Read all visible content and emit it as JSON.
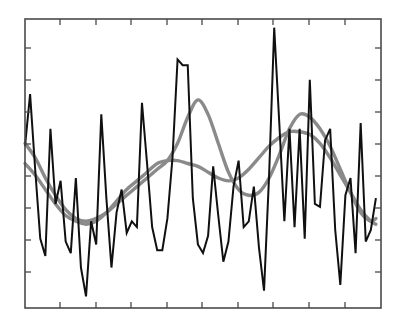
{
  "figure": {
    "title": "",
    "background_color": "#ffffff"
  },
  "axes": {
    "frame_color": "#4a4a4a",
    "frame_left": 25,
    "frame_top": 19,
    "frame_right": 381,
    "frame_bottom": 308,
    "tick_direction": "in",
    "tick_length": 6,
    "x_tick_count": 9,
    "y_tick_count": 8,
    "x_tick_positions": [
      60,
      96,
      131,
      167,
      202,
      238,
      273,
      309,
      345
    ],
    "y_tick_positions": [
      48,
      80,
      112,
      144,
      176,
      208,
      240,
      272
    ],
    "x_tick_labels": [],
    "y_tick_labels": [],
    "xlabel": "",
    "ylabel": ""
  },
  "chart_data": {
    "type": "line",
    "title": "",
    "subtitle": "",
    "xlabel": "",
    "ylabel": "",
    "xlim": [
      0,
      70
    ],
    "ylim": [
      0,
      100
    ],
    "grid": false,
    "legend": false,
    "legend_position": "none",
    "tick_labels_shown": false,
    "annotations": [],
    "series": [
      {
        "name": "observed",
        "color": "#101010",
        "line_width": 2.0,
        "style": "jagged-noisy",
        "x": [
          0,
          1,
          2,
          3,
          4,
          5,
          6,
          7,
          8,
          9,
          10,
          11,
          12,
          13,
          14,
          15,
          16,
          17,
          18,
          19,
          20,
          21,
          22,
          23,
          24,
          25,
          26,
          27,
          28,
          29,
          30,
          31,
          32,
          33,
          34,
          35,
          36,
          37,
          38,
          39,
          40,
          41,
          42,
          43,
          44,
          45,
          46,
          47,
          48,
          49,
          50,
          51,
          52,
          53,
          54,
          55,
          56,
          57,
          58,
          59,
          60,
          61,
          62,
          63,
          64,
          65,
          66,
          67,
          68,
          69
        ],
        "values": [
          56,
          74,
          48,
          24,
          18,
          62,
          36,
          44,
          23,
          19,
          45,
          14,
          4,
          30,
          22,
          67,
          38,
          14,
          33,
          41,
          26,
          30,
          28,
          71,
          50,
          28,
          20,
          20,
          31,
          52,
          86,
          84,
          84,
          38,
          22,
          19,
          25,
          49,
          32,
          16,
          23,
          42,
          51,
          28,
          30,
          42,
          21,
          6,
          46,
          97,
          64,
          30,
          62,
          28,
          62,
          24,
          79,
          36,
          35,
          58,
          62,
          27,
          8,
          39,
          45,
          19,
          64,
          23,
          27,
          38
        ]
      },
      {
        "name": "smooth-trend-a",
        "color": "#8a8a8a",
        "line_width": 3.4,
        "style": "smooth",
        "x": [
          0,
          2,
          4,
          6,
          8,
          10,
          12,
          14,
          16,
          18,
          20,
          22,
          24,
          26,
          28,
          30,
          32,
          34,
          36,
          38,
          40,
          42,
          44,
          46,
          48,
          50,
          52,
          54,
          56,
          58,
          60,
          62,
          64,
          66,
          68,
          69
        ],
        "values": [
          57,
          52,
          45,
          39,
          34,
          31,
          30,
          31,
          33,
          36,
          39,
          42,
          45,
          48,
          51,
          57,
          66,
          72,
          67,
          57,
          47,
          41,
          39,
          40,
          45,
          53,
          62,
          67,
          66,
          62,
          56,
          48,
          40,
          33,
          30,
          31
        ]
      },
      {
        "name": "smooth-trend-b",
        "color": "#8a8a8a",
        "line_width": 3.4,
        "style": "smooth",
        "x": [
          0,
          2,
          4,
          6,
          8,
          10,
          12,
          14,
          16,
          18,
          20,
          22,
          24,
          26,
          28,
          30,
          32,
          34,
          36,
          38,
          40,
          42,
          44,
          46,
          48,
          50,
          52,
          54,
          56,
          58,
          60,
          62,
          64,
          66,
          68,
          69
        ],
        "values": [
          50,
          46,
          41,
          36,
          32,
          30,
          29,
          30,
          33,
          37,
          41,
          44,
          47,
          50,
          51,
          51,
          50,
          49,
          47,
          45,
          44,
          45,
          48,
          52,
          56,
          59,
          61,
          61,
          60,
          57,
          52,
          46,
          40,
          34,
          30,
          29
        ]
      }
    ]
  }
}
